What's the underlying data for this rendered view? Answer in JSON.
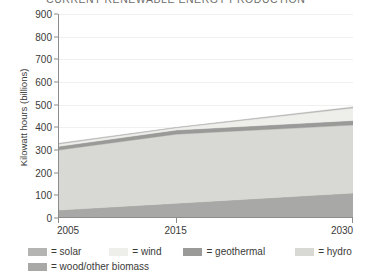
{
  "chart_data": {
    "type": "area",
    "title": "CURRENT RENEWABLE ENERGY PRODUCTION",
    "xlabel": "",
    "ylabel": "Kilowatt hours (billions)",
    "stacked": true,
    "grid": true,
    "legend_position": "bottom",
    "x": [
      2005,
      2015,
      2030
    ],
    "xtick_labels": [
      "2005",
      "2015",
      "2030"
    ],
    "xlim": [
      2005,
      2030
    ],
    "ylim": [
      0,
      900
    ],
    "ytick_labels": [
      "0",
      "100",
      "200",
      "300",
      "400",
      "500",
      "600",
      "700",
      "800",
      "900"
    ],
    "ytick_values": [
      0,
      100,
      200,
      300,
      400,
      500,
      600,
      700,
      800,
      900
    ],
    "series": [
      {
        "name": "wood/other biomass",
        "values": [
          35,
          65,
          110
        ],
        "color": "#a8a8a6"
      },
      {
        "name": "hydro",
        "values": [
          265,
          305,
          300
        ],
        "color": "#d8d8d4"
      },
      {
        "name": "geothermal",
        "values": [
          16,
          18,
          20
        ],
        "color": "#9a9a98"
      },
      {
        "name": "wind",
        "values": [
          10,
          10,
          55
        ],
        "color": "#eeeeea"
      },
      {
        "name": "solar",
        "values": [
          4,
          2,
          5
        ],
        "color": "#b4b4b2"
      }
    ],
    "stack_tops": {
      "2005": {
        "biomass": 35,
        "hydro": 300,
        "geothermal": 316,
        "wind": 326,
        "solar": 330
      },
      "2015": {
        "biomass": 65,
        "hydro": 370,
        "geothermal": 388,
        "wind": 398,
        "solar": 400
      },
      "2030": {
        "biomass": 110,
        "hydro": 410,
        "geothermal": 430,
        "wind": 485,
        "solar": 490
      }
    }
  },
  "legend": {
    "row1": [
      {
        "label": "= solar",
        "color": "#b4b4b2",
        "name": "solar"
      },
      {
        "label": "= wind",
        "color": "#eeeeea",
        "name": "wind"
      },
      {
        "label": "= geothermal",
        "color": "#9a9a98",
        "name": "geothermal"
      },
      {
        "label": "= hydro",
        "color": "#d8d8d4",
        "name": "hydro"
      }
    ],
    "row2": [
      {
        "label": "= wood/other biomass",
        "color": "#a8a8a6",
        "name": "wood-other-biomass"
      }
    ]
  }
}
